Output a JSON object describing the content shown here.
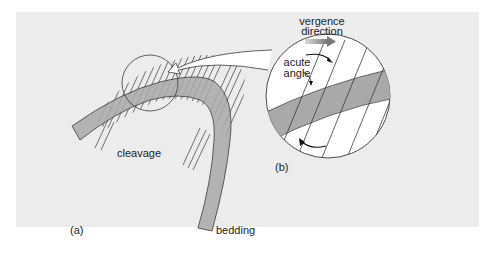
{
  "figure": {
    "panel_bg": "#ececec",
    "bed_fill": "#a9a9a9",
    "bed_fill_light": "#b5b5b5",
    "line_color": "#3a3a3a",
    "labels": {
      "panel_a": "(a)",
      "panel_b": "(b)",
      "cleavage": "cleavage",
      "bedding": "bedding",
      "vergence_line1": "vergence",
      "vergence_line2": "direction",
      "acute_line1": "acute",
      "acute_line2": "angle"
    }
  }
}
